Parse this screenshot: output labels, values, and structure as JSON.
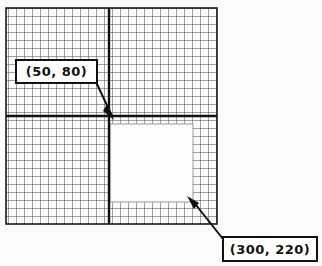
{
  "figure": {
    "background_color": "#fbfbf9",
    "line_color": "#1a1a1a",
    "grid_line_color": "#555555",
    "cutout_fill": "#fdfdfb"
  },
  "grid": {
    "left": 6,
    "top": 8,
    "right": 217,
    "bottom": 224,
    "cell_size": 8,
    "major_vertical_x": 109,
    "major_horizontal_y": 116
  },
  "cutout": {
    "left": 110,
    "top": 124,
    "right": 193,
    "bottom": 202
  },
  "callouts": [
    {
      "id": "callout-a",
      "label": "(50, 80)",
      "points_to": "major-grid-intersection"
    },
    {
      "id": "callout-b",
      "label": "(300, 220)",
      "points_to": "cutout-bottom-right-corner"
    }
  ],
  "annotations": {
    "leader_a": {
      "from_x": 97,
      "from_y": 83,
      "to_x": 115,
      "to_y": 120
    },
    "leader_b": {
      "from_x": 222,
      "from_y": 240,
      "to_x": 188,
      "to_y": 197
    }
  }
}
